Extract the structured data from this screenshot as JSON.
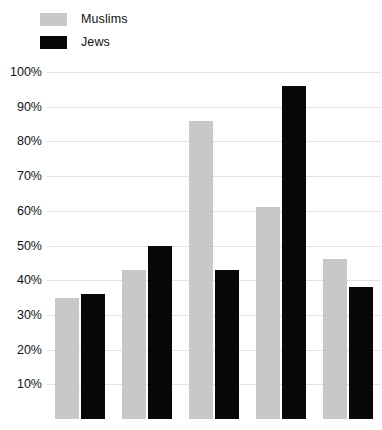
{
  "legend": {
    "position": "top-left",
    "items": [
      {
        "label": "Muslims",
        "color": "#c8c8c8",
        "swatch_name": "legend-swatch-muslims"
      },
      {
        "label": "Jews",
        "color": "#080808",
        "swatch_name": "legend-swatch-jews"
      }
    ]
  },
  "axis": {
    "y_ticks": [
      "100%",
      "90%",
      "80%",
      "70%",
      "60%",
      "50%",
      "40%",
      "30%",
      "20%",
      "10%"
    ],
    "x_ticks": []
  },
  "chart_data": {
    "type": "bar",
    "title": "",
    "subtitle": "",
    "xlabel": "",
    "ylabel": "",
    "ylim": [
      0,
      100
    ],
    "yunit": "%",
    "ytick_values": [
      10,
      20,
      30,
      40,
      50,
      60,
      70,
      80,
      90,
      100
    ],
    "ytick_labels": [
      "10%",
      "20%",
      "30%",
      "40%",
      "50%",
      "60%",
      "70%",
      "80%",
      "90%",
      "100%"
    ],
    "grid": true,
    "grid_axis": "y",
    "legend": [
      "Muslims",
      "Jews"
    ],
    "legend_position": "top-left",
    "categories": [
      "",
      "",
      "",
      "",
      ""
    ],
    "series": [
      {
        "name": "Muslims",
        "color": "#c8c8c8",
        "values": [
          35,
          43,
          86,
          61,
          46
        ]
      },
      {
        "name": "Jews",
        "color": "#080808",
        "values": [
          36,
          50,
          43,
          96,
          38
        ]
      }
    ],
    "annotations": []
  }
}
